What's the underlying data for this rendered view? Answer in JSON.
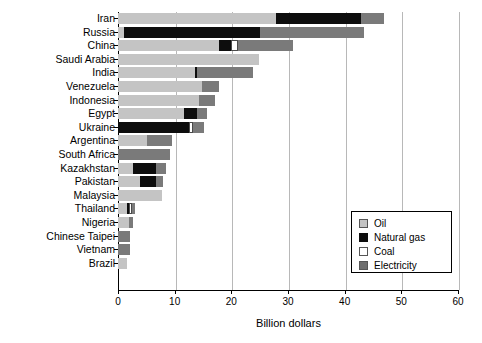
{
  "chart_data": {
    "type": "bar",
    "orientation": "horizontal",
    "stacked": true,
    "title": "",
    "xlabel": "Billion dollars",
    "ylabel": "",
    "xlim": [
      0,
      60
    ],
    "xticks": [
      0,
      10,
      20,
      30,
      40,
      50,
      60
    ],
    "grid": true,
    "legend_position": "center-right",
    "categories": [
      "Iran",
      "Russia",
      "China",
      "Saudi Arabia",
      "India",
      "Venezuela",
      "Indonesia",
      "Egypt",
      "Ukraine",
      "Argentina",
      "South Africa",
      "Kazakhstan",
      "Pakistan",
      "Malaysia",
      "Thailand",
      "Nigeria",
      "Chinese Taipei",
      "Vietnam",
      "Brazil"
    ],
    "series": [
      {
        "name": "Oil",
        "color": "#c4c4c4",
        "values": [
          27.8,
          1.0,
          17.9,
          24.8,
          13.5,
          14.8,
          14.3,
          11.6,
          0.0,
          5.1,
          0.0,
          2.6,
          3.9,
          7.8,
          1.6,
          1.9,
          0.0,
          0.0,
          1.5
        ]
      },
      {
        "name": "Natural gas",
        "color": "#0d0d0d",
        "values": [
          15.0,
          24.0,
          2.0,
          0.0,
          0.5,
          0.0,
          0.0,
          2.3,
          12.6,
          0.0,
          0.0,
          4.1,
          2.8,
          0.0,
          0.3,
          0.0,
          0.0,
          0.0,
          0.0
        ]
      },
      {
        "name": "Coal",
        "color": "#ffffff",
        "values": [
          0.0,
          0.0,
          1.2,
          0.0,
          0.0,
          0.0,
          0.0,
          0.0,
          0.7,
          0.0,
          0.0,
          0.0,
          0.0,
          0.0,
          0.6,
          0.0,
          0.0,
          0.0,
          0.0
        ]
      },
      {
        "name": "Electricity",
        "color": "#7a7a7a",
        "values": [
          4.2,
          18.4,
          9.7,
          0.0,
          9.8,
          3.1,
          2.8,
          1.8,
          1.8,
          4.4,
          9.2,
          1.7,
          1.3,
          0.0,
          0.5,
          0.8,
          2.2,
          2.2,
          0.0
        ]
      }
    ],
    "totals": [
      47.0,
      43.4,
      30.8,
      24.8,
      23.8,
      17.9,
      17.1,
      15.7,
      15.1,
      9.5,
      9.2,
      8.4,
      8.0,
      7.8,
      3.0,
      2.7,
      2.2,
      2.2,
      1.5
    ],
    "legend_entries": [
      "Oil",
      "Natural gas",
      "Coal",
      "Electricity"
    ],
    "tick_labels": [
      "0",
      "10",
      "20",
      "30",
      "40",
      "50",
      "60"
    ]
  }
}
